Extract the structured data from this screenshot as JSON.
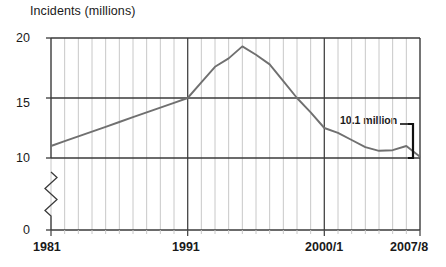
{
  "chart_data": {
    "type": "line",
    "title": "Incidents (millions)",
    "xlabel": "",
    "ylabel": "Incidents (millions)",
    "ylim": [
      0,
      20
    ],
    "yticks": [
      "0",
      "10",
      "15",
      "20"
    ],
    "ytick_values": [
      0,
      10,
      15,
      20
    ],
    "y_axis_break": true,
    "y_axis_break_between": [
      0,
      10
    ],
    "grid": true,
    "grid_minor_interval_years": 1,
    "major_gridline_years": [
      "1991",
      "2000/1"
    ],
    "legend": "none",
    "xticks": [
      "1981",
      "1991",
      "2000/1",
      "2007/8"
    ],
    "xtick_years": [
      1981,
      1991,
      2001,
      2008
    ],
    "xlim": [
      1981,
      2008
    ],
    "annotations": [
      {
        "text": "10.1 million",
        "year": 2008,
        "value": 10.1,
        "style": "bracket-right"
      }
    ],
    "series": [
      {
        "name": "Incidents",
        "color": "#707070",
        "x": [
          1981,
          1982,
          1983,
          1984,
          1985,
          1986,
          1987,
          1988,
          1989,
          1990,
          1991,
          1992,
          1993,
          1994,
          1995,
          1996,
          1997,
          1998,
          1999,
          2000,
          2001,
          2002,
          2003,
          2004,
          2005,
          2006,
          2007,
          2008
        ],
        "values": [
          11.0,
          11.4,
          11.8,
          12.2,
          12.6,
          13.0,
          13.4,
          13.8,
          14.2,
          14.6,
          15.0,
          16.3,
          17.6,
          18.3,
          19.3,
          18.6,
          17.8,
          16.4,
          15.0,
          13.8,
          12.5,
          12.1,
          11.5,
          10.9,
          10.6,
          10.65,
          11.0,
          10.1
        ]
      }
    ]
  },
  "colors": {
    "line": "#707070",
    "grid_minor": "#c8c8c8",
    "grid_major": "#4a4a4a",
    "axis": "#3a3a3a",
    "bracket": "#111111",
    "text": "#1a1a1a",
    "background": "#ffffff"
  }
}
